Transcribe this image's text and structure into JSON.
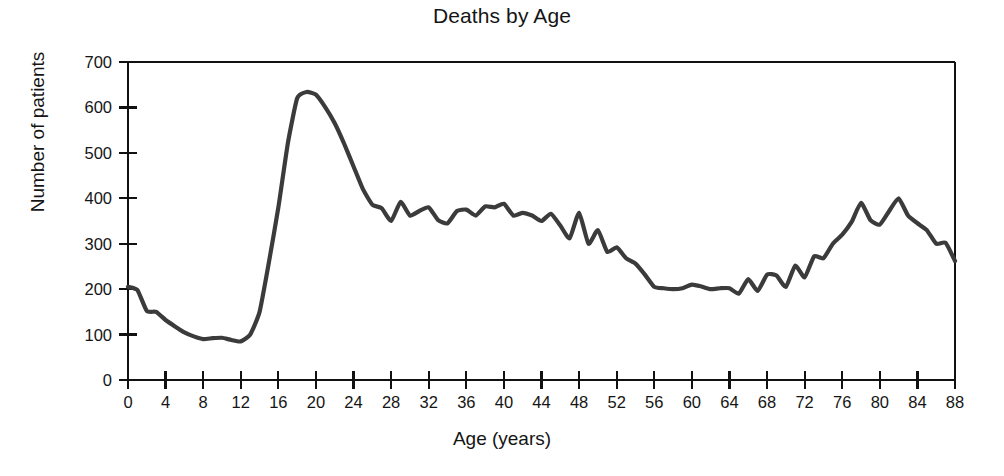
{
  "chart_data": {
    "type": "line",
    "title": "Deaths by Age",
    "xlabel": "Age (years)",
    "ylabel": "Number of patients",
    "xlim": [
      0,
      88
    ],
    "ylim": [
      0,
      700
    ],
    "grid": false,
    "legend": null,
    "xticks": [
      0,
      4,
      8,
      12,
      16,
      20,
      24,
      28,
      32,
      36,
      40,
      44,
      48,
      52,
      56,
      60,
      64,
      68,
      72,
      76,
      80,
      84,
      88
    ],
    "yticks": [
      0,
      100,
      200,
      300,
      400,
      500,
      600,
      700
    ],
    "xtick_labels": [
      "0",
      "4",
      "8",
      "12",
      "16",
      "20",
      "24",
      "28",
      "32",
      "36",
      "40",
      "44",
      "48",
      "52",
      "56",
      "60",
      "64",
      "68",
      "72",
      "76",
      "80",
      "84",
      "88"
    ],
    "ytick_labels": [
      "0",
      "100",
      "200",
      "300",
      "400",
      "500",
      "600",
      "700"
    ],
    "line_color": "#3b3b3b",
    "line_width": 4.2,
    "series": [
      {
        "name": "Deaths",
        "x": [
          0,
          1,
          2,
          3,
          4,
          5,
          6,
          7,
          8,
          9,
          10,
          11,
          12,
          13,
          14,
          15,
          16,
          17,
          18,
          19,
          20,
          21,
          22,
          23,
          24,
          25,
          26,
          27,
          28,
          29,
          30,
          31,
          32,
          33,
          34,
          35,
          36,
          37,
          38,
          39,
          40,
          41,
          42,
          43,
          44,
          45,
          46,
          47,
          48,
          49,
          50,
          51,
          52,
          53,
          54,
          55,
          56,
          57,
          58,
          59,
          60,
          61,
          62,
          63,
          64,
          65,
          66,
          67,
          68,
          69,
          70,
          71,
          72,
          73,
          74,
          75,
          76,
          77,
          78,
          79,
          80,
          81,
          82,
          83,
          84,
          85,
          86,
          87,
          88
        ],
        "values": [
          205,
          198,
          152,
          150,
          132,
          118,
          105,
          96,
          90,
          92,
          93,
          88,
          85,
          100,
          150,
          260,
          380,
          520,
          620,
          634,
          628,
          600,
          565,
          520,
          470,
          420,
          386,
          378,
          350,
          392,
          362,
          372,
          380,
          352,
          345,
          372,
          375,
          362,
          382,
          380,
          388,
          362,
          368,
          362,
          350,
          366,
          340,
          312,
          368,
          300,
          330,
          282,
          292,
          268,
          256,
          232,
          205,
          202,
          200,
          202,
          210,
          206,
          200,
          202,
          202,
          190,
          222,
          196,
          232,
          230,
          205,
          252,
          226,
          272,
          268,
          300,
          320,
          348,
          390,
          352,
          342,
          372,
          400,
          362,
          345,
          330,
          300,
          302,
          262
        ]
      }
    ]
  }
}
